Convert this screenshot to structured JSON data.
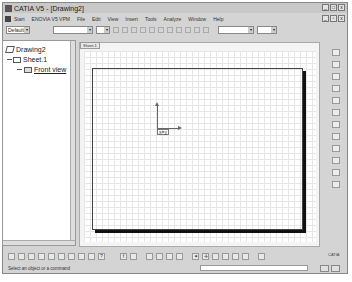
{
  "window": {
    "title": "CATIA V5 - [Drawing2]",
    "controls": [
      "_",
      "□",
      "x"
    ],
    "doc_controls": [
      "_",
      "▫",
      "x"
    ]
  },
  "menubar": {
    "items": [
      "Start",
      "ENOVIA V5 VPM",
      "File",
      "Edit",
      "View",
      "Insert",
      "Tools",
      "Analyze",
      "Window",
      "Help"
    ]
  },
  "toolbar": {
    "style_combo": "Default",
    "font_combo": "",
    "size_combo": "",
    "format_buttons": [
      "B",
      "I",
      "U",
      "S"
    ]
  },
  "tree": {
    "root": "Drawing2",
    "sheet": "Sheet.1",
    "view": "Front view"
  },
  "sheet_tab": "Sheet.1",
  "origin_label": "x=y",
  "status": {
    "message": "Select an object or a command"
  },
  "brand": "CATIA"
}
